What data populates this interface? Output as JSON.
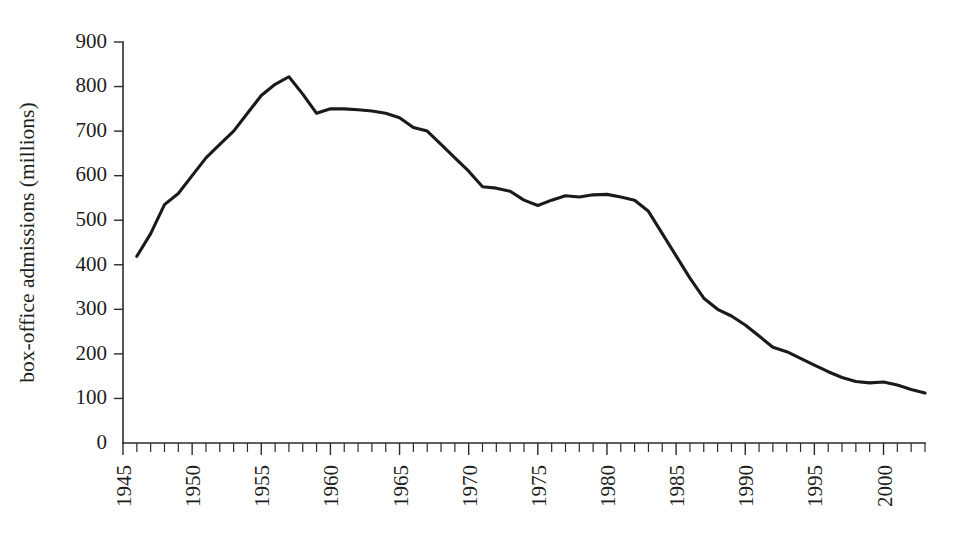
{
  "chart_data": {
    "type": "line",
    "title": "",
    "xlabel": "",
    "ylabel": "box-office admissions (millions)",
    "xlim": [
      1945,
      2003
    ],
    "ylim": [
      0,
      900
    ],
    "grid": false,
    "legend": false,
    "y_ticks": [
      0,
      100,
      200,
      300,
      400,
      500,
      600,
      700,
      800,
      900
    ],
    "y_tick_labels": [
      "0",
      "100",
      "200",
      "300",
      "400",
      "500",
      "600",
      "700",
      "800",
      "900"
    ],
    "x_tick_labels": [
      "1945",
      "1950",
      "1955",
      "1960",
      "1965",
      "1970",
      "1975",
      "1980",
      "1985",
      "1990",
      "1995",
      "2000"
    ],
    "x_tick_label_values": [
      1945,
      1950,
      1955,
      1960,
      1965,
      1970,
      1975,
      1980,
      1985,
      1990,
      1995,
      2000
    ],
    "x_minor_tick_step": 1,
    "series": [
      {
        "name": "box-office admissions",
        "x": [
          1946,
          1947,
          1948,
          1949,
          1950,
          1951,
          1952,
          1953,
          1954,
          1955,
          1956,
          1957,
          1958,
          1959,
          1960,
          1961,
          1962,
          1963,
          1964,
          1965,
          1966,
          1967,
          1968,
          1969,
          1970,
          1971,
          1972,
          1973,
          1974,
          1975,
          1976,
          1977,
          1978,
          1979,
          1980,
          1981,
          1982,
          1983,
          1984,
          1985,
          1986,
          1987,
          1988,
          1989,
          1990,
          1991,
          1992,
          1993,
          1994,
          1995,
          1996,
          1997,
          1998,
          1999,
          2000,
          2001,
          2002,
          2003
        ],
        "values": [
          419,
          470,
          535,
          560,
          600,
          640,
          670,
          700,
          740,
          780,
          805,
          822,
          783,
          740,
          750,
          750,
          748,
          745,
          740,
          730,
          708,
          700,
          670,
          640,
          610,
          575,
          572,
          565,
          545,
          533,
          545,
          555,
          552,
          557,
          558,
          552,
          545,
          520,
          470,
          420,
          370,
          325,
          300,
          285,
          265,
          240,
          215,
          205,
          190,
          175,
          160,
          147,
          138,
          135,
          137,
          130,
          120,
          112
        ],
        "color": "#1a1a1a"
      }
    ],
    "annotations": []
  },
  "axes": {
    "y_axis_title": "box-office admissions (millions)",
    "origin_label": "0"
  },
  "caption": {
    "text": ""
  }
}
